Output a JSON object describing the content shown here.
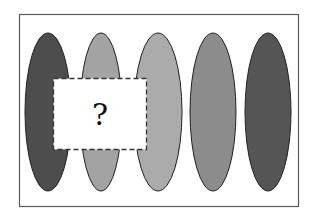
{
  "puzzle": {
    "description": "Sequence of five vertical ellipses with varying gray shades; a dashed box hides part of the first two ellipses",
    "frame": {
      "border_color": "#5a5a5a"
    },
    "ellipses": [
      {
        "index": 1,
        "fill": "#4d4d4d"
      },
      {
        "index": 2,
        "fill": "#a3a3a3"
      },
      {
        "index": 3,
        "fill": "#ababab"
      },
      {
        "index": 4,
        "fill": "#8c8c8c"
      },
      {
        "index": 5,
        "fill": "#555555"
      }
    ],
    "hidden_box": {
      "label": "?",
      "border_style": "dashed"
    }
  }
}
